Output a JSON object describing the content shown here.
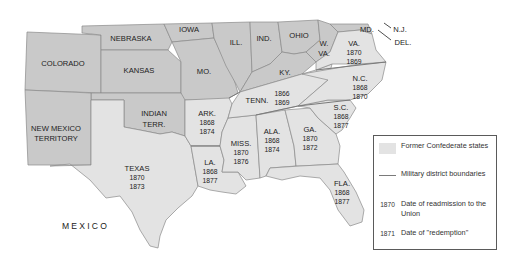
{
  "map": {
    "title": "Reconstruction in the South",
    "colors": {
      "background": "#ffffff",
      "union_states": "#c9c9c9",
      "confederate_states": "#e3e3e3",
      "borders": "#8a8a8a",
      "district_lines": "#7a7a7a"
    },
    "union_labels": {
      "colorado": "COLORADO",
      "nebraska": "NEBRASKA",
      "iowa": "IOWA",
      "kansas": "KANSAS",
      "missouri": "MO.",
      "illinois": "ILL.",
      "indiana": "IND.",
      "ohio": "OHIO",
      "kentucky": "KY.",
      "west_virginia_1": "W.",
      "west_virginia_2": "VA.",
      "maryland": "MD.",
      "new_jersey": "N.J.",
      "delaware": "DEL.",
      "indian_territory_1": "INDIAN",
      "indian_territory_2": "TERR.",
      "new_mexico_1": "NEW MEXICO",
      "new_mexico_2": "TERRITORY",
      "mexico": "MEXICO"
    },
    "confederate_states": [
      {
        "name": "TEXAS",
        "readmission": "1870",
        "redemption": "1873"
      },
      {
        "name": "ARK.",
        "readmission": "1868",
        "redemption": "1874"
      },
      {
        "name": "LA.",
        "readmission": "1868",
        "redemption": "1877"
      },
      {
        "name": "MISS.",
        "readmission": "1870",
        "redemption": "1876"
      },
      {
        "name": "ALA.",
        "readmission": "1868",
        "redemption": "1874"
      },
      {
        "name": "GA.",
        "readmission": "1870",
        "redemption": "1872"
      },
      {
        "name": "FLA.",
        "readmission": "1868",
        "redemption": "1877"
      },
      {
        "name": "S.C.",
        "readmission": "1868",
        "redemption": "1877"
      },
      {
        "name": "N.C.",
        "readmission": "1868",
        "redemption": "1870"
      },
      {
        "name": "TENN.",
        "readmission": "1866",
        "redemption": "1869"
      },
      {
        "name": "VA.",
        "readmission": "1870",
        "redemption": "1869"
      }
    ]
  },
  "legend": {
    "items": [
      {
        "key": "swatch",
        "text": "Former Confederate states"
      },
      {
        "key": "line",
        "text": "Military district boundaries"
      },
      {
        "key": "1870",
        "text": "Date of readmission to the Union"
      },
      {
        "key": "1871",
        "text": "Date of \"redemption\""
      }
    ]
  }
}
